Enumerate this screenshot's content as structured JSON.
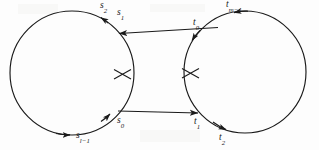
{
  "figure": {
    "background_color": "#fdfdfd",
    "stroke_color": "#1a1a1a",
    "label_color": "#1a1a1a"
  },
  "left_cycle": {
    "name": "s-cycle",
    "center_x": 72,
    "center_y": 73,
    "radius": 62,
    "labels": {
      "s2": "s",
      "s2_sub": "2",
      "s1": "s",
      "s1_sub": "1",
      "s0": "s",
      "s0_sub": "0",
      "sl1": "s",
      "sl1_sub": "l−1"
    }
  },
  "right_cycle": {
    "name": "t-cycle",
    "center_x": 245,
    "center_y": 72,
    "radius": 61,
    "labels": {
      "tm1": "t",
      "tm1_sub": "m−1",
      "t0": "t",
      "t0_sub": "0",
      "t1": "t",
      "t1_sub": "1",
      "t2": "t",
      "t2_sub": "2"
    }
  },
  "connectors": {
    "upper": {
      "name": "t0-to-s1-arrow",
      "direction": "leftward",
      "from_x": 218,
      "from_y": 28,
      "to_x": 122,
      "to_y": 33
    },
    "lower": {
      "name": "s0-to-t1-arrow",
      "direction": "rightward",
      "from_x": 121,
      "from_y": 111,
      "to_x": 196,
      "to_y": 113
    }
  },
  "cut_marks": [
    {
      "name": "left-cut-mark",
      "x": 123,
      "y": 74
    },
    {
      "name": "right-cut-mark",
      "x": 190,
      "y": 73
    }
  ]
}
